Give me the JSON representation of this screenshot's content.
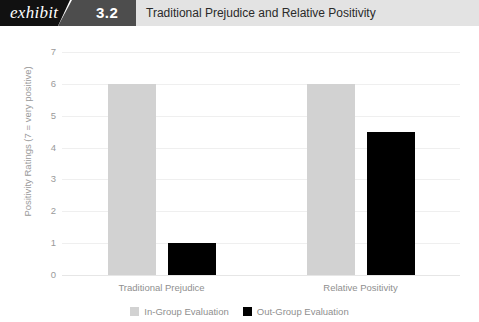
{
  "header": {
    "exhibit_label": "exhibit",
    "number": "3.2",
    "title": "Traditional Prejudice and Relative Positivity",
    "colors": {
      "black_block": "#111111",
      "gray_block": "#4d4d4d",
      "title_bar": "#e3e3e3"
    }
  },
  "chart_data": {
    "type": "bar",
    "title": "Traditional Prejudice and Relative Positivity",
    "xlabel": "",
    "ylabel": "Positivity Ratings (7 = very positive)",
    "ylim": [
      0,
      7
    ],
    "yticks": [
      0,
      1,
      2,
      3,
      4,
      5,
      6,
      7
    ],
    "ytick_labels": [
      "0",
      "1",
      "2",
      "3",
      "4",
      "5",
      "6",
      "7"
    ],
    "categories": [
      "Traditional Prejudice",
      "Relative Positivity"
    ],
    "series": [
      {
        "name": "In-Group Evaluation",
        "color": "#d2d2d2",
        "values": [
          6,
          6
        ]
      },
      {
        "name": "Out-Group Evaluation",
        "color": "#000000",
        "values": [
          1,
          4.5
        ]
      }
    ],
    "grid": true,
    "legend_position": "bottom"
  }
}
